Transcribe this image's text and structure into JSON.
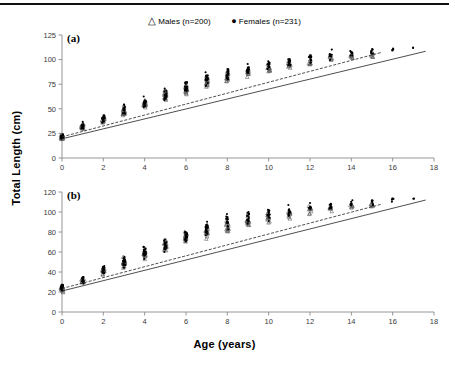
{
  "figure": {
    "legend": [
      {
        "marker": "triangle-open",
        "glyph": "△",
        "label": "Males (n=200)"
      },
      {
        "marker": "circle-filled",
        "glyph": "●",
        "label": "Females (n=231)"
      }
    ],
    "xlabel": "Age (years)",
    "ylabel": "Total Length (cm)",
    "panel_tags": [
      "(a)",
      "(b)"
    ],
    "colors": {
      "ink": "#000000",
      "axis": "#8a8a8a",
      "tick_text": "#3a3a3a"
    }
  },
  "chart_data": [
    {
      "type": "scatter",
      "panel": "(a)",
      "title": "",
      "xlabel": "Age (years)",
      "ylabel": "Total Length (cm)",
      "xlim": [
        0,
        18
      ],
      "ylim": [
        0,
        125
      ],
      "xticks": [
        0,
        2,
        4,
        6,
        8,
        10,
        12,
        14,
        16,
        18
      ],
      "yticks": [
        0,
        25,
        50,
        75,
        100,
        125
      ],
      "grid": false,
      "legend_position": "top-center",
      "series": [
        {
          "name": "Males (n=200)",
          "marker": "triangle-open",
          "x": [
            0,
            1,
            2,
            3,
            4,
            5,
            6,
            7,
            8,
            9,
            10,
            11,
            12,
            13,
            14,
            15
          ],
          "mean": [
            21,
            31,
            39,
            47,
            55,
            63,
            71,
            77,
            82,
            87,
            91,
            95,
            98,
            101,
            103,
            105
          ],
          "spread": [
            4,
            4,
            6,
            7,
            8,
            8,
            9,
            9,
            9,
            8,
            8,
            7,
            7,
            6,
            6,
            4
          ],
          "counts": [
            14,
            12,
            14,
            16,
            17,
            16,
            17,
            16,
            15,
            13,
            12,
            10,
            9,
            7,
            6,
            6
          ]
        },
        {
          "name": "Females (n=231)",
          "marker": "circle-filled",
          "x": [
            0,
            1,
            2,
            3,
            4,
            5,
            6,
            7,
            8,
            9,
            10,
            11,
            12,
            13,
            14,
            15,
            16,
            17
          ],
          "mean": [
            22,
            32,
            40,
            48,
            56,
            64,
            72,
            79,
            85,
            90,
            94,
            98,
            101,
            104,
            106,
            108,
            110,
            112
          ],
          "spread": [
            5,
            5,
            7,
            8,
            9,
            9,
            10,
            10,
            10,
            9,
            9,
            8,
            7,
            7,
            6,
            5,
            4,
            2
          ],
          "counts": [
            16,
            14,
            16,
            18,
            19,
            18,
            19,
            18,
            17,
            15,
            14,
            12,
            11,
            9,
            8,
            7,
            5,
            2
          ]
        }
      ],
      "fit_lines": [
        {
          "name": "Males fit",
          "style": "solid",
          "x": [
            0,
            17.6
          ],
          "y": [
            19.5,
            108.5
          ]
        },
        {
          "name": "Females fit",
          "style": "dashed",
          "x": [
            0,
            15.5
          ],
          "y": [
            21.5,
            107.5
          ]
        }
      ]
    },
    {
      "type": "scatter",
      "panel": "(b)",
      "title": "",
      "xlabel": "Age (years)",
      "ylabel": "Total Length (cm)",
      "xlim": [
        0,
        18
      ],
      "ylim": [
        0,
        120
      ],
      "xticks": [
        0,
        2,
        4,
        6,
        8,
        10,
        12,
        14,
        16,
        18
      ],
      "yticks": [
        0,
        20,
        40,
        60,
        80,
        100,
        120
      ],
      "grid": false,
      "legend_position": "top-center",
      "series": [
        {
          "name": "Males (n=200)",
          "marker": "triangle-open",
          "x": [
            0,
            1,
            2,
            3,
            4,
            5,
            6,
            7,
            8,
            9,
            10,
            11,
            12,
            13,
            14,
            15
          ],
          "mean": [
            23,
            32,
            41,
            50,
            58,
            66,
            74,
            81,
            86,
            91,
            95,
            98,
            101,
            103,
            105,
            107
          ],
          "spread": [
            4,
            4,
            6,
            7,
            8,
            9,
            9,
            10,
            9,
            9,
            8,
            7,
            7,
            6,
            6,
            4
          ],
          "counts": [
            14,
            12,
            14,
            16,
            17,
            16,
            17,
            16,
            15,
            13,
            12,
            10,
            9,
            7,
            6,
            6
          ]
        },
        {
          "name": "Females (n=231)",
          "marker": "circle-filled",
          "x": [
            0,
            1,
            2,
            3,
            4,
            5,
            6,
            7,
            8,
            9,
            10,
            11,
            12,
            13,
            14,
            15,
            16,
            17
          ],
          "mean": [
            24,
            33,
            42,
            51,
            60,
            68,
            76,
            83,
            89,
            94,
            98,
            101,
            104,
            106,
            108,
            110,
            111,
            113
          ],
          "spread": [
            5,
            5,
            7,
            8,
            9,
            10,
            10,
            11,
            10,
            10,
            9,
            8,
            7,
            7,
            6,
            5,
            4,
            2
          ],
          "counts": [
            16,
            14,
            16,
            18,
            19,
            18,
            19,
            18,
            17,
            15,
            14,
            12,
            11,
            9,
            8,
            7,
            5,
            2
          ]
        }
      ],
      "fit_lines": [
        {
          "name": "Males fit",
          "style": "solid",
          "x": [
            0,
            17.6
          ],
          "y": [
            21.0,
            112.0
          ]
        },
        {
          "name": "Females fit",
          "style": "dashed",
          "x": [
            0,
            15.5
          ],
          "y": [
            23.5,
            108.0
          ]
        }
      ]
    }
  ]
}
